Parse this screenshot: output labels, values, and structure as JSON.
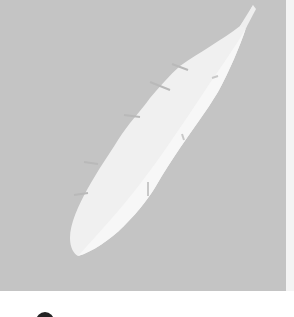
{
  "image": {
    "subject": "white feather on gray background",
    "background_color": "#c4c4c4",
    "feather_color": "#f0f0f0",
    "feather_highlight_color": "#f7f7f7",
    "feather_notch_color": "#b9b9b9"
  },
  "caption": {
    "icon": "circle-icon",
    "text": "",
    "note_visible": "cut off at bottom edge"
  }
}
